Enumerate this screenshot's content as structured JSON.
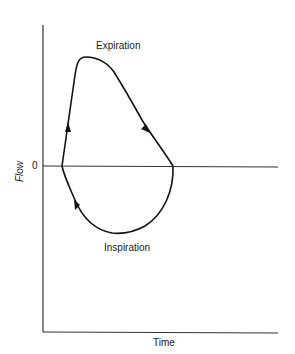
{
  "diagram": {
    "type": "flow-time loop",
    "axes": {
      "x_label": "Time",
      "y_label": "Flow",
      "zero_label": "0"
    },
    "annotations": {
      "upper": "Expiration",
      "lower": "Inspiration"
    },
    "colors": {
      "line": "#111111",
      "axis": "#333333",
      "background": "#ffffff"
    }
  }
}
